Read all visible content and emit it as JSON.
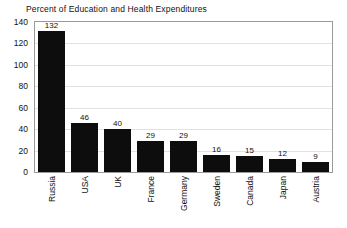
{
  "chart_data": {
    "type": "bar",
    "title": "Percent of Education and Health Expenditures",
    "xlabel": "",
    "ylabel": "",
    "ylim": [
      0,
      140
    ],
    "yticks": [
      0,
      20,
      40,
      60,
      80,
      100,
      120,
      140
    ],
    "ytick_labels": [
      "0",
      "20",
      "40",
      "60",
      "80",
      "100",
      "120",
      "140"
    ],
    "grid": true,
    "legend": false,
    "bar_color": "#0d0d0d",
    "categories": [
      "Russia",
      "USA",
      "UK",
      "France",
      "Germany",
      "Sweden",
      "Canada",
      "Japan",
      "Austria"
    ],
    "values": [
      132,
      46,
      40,
      29,
      29,
      16,
      15,
      12,
      9
    ],
    "value_labels": [
      "132",
      "46",
      "40",
      "29",
      "29",
      "16",
      "15",
      "12",
      "9"
    ]
  }
}
